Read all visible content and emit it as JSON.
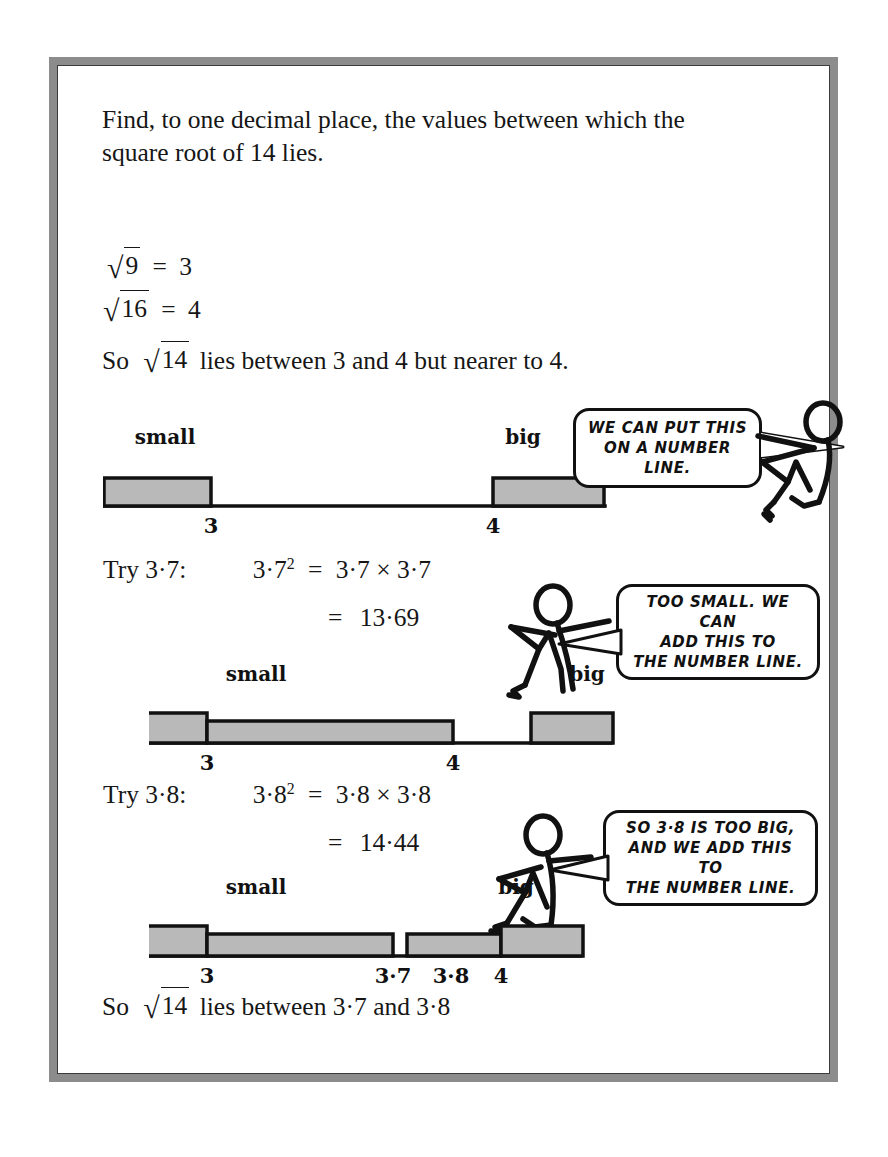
{
  "page": {
    "border_color": "#8c8c8c",
    "background": "#ffffff",
    "ink_color": "#161616"
  },
  "question": {
    "line1": "Find, to one decimal place, the values between which the",
    "line2": "square root of 14 lies."
  },
  "working": {
    "root9": {
      "sign": "√",
      "radicand": "9",
      "equals": "=",
      "result": "3"
    },
    "root16": {
      "sign": "√",
      "radicand": "16",
      "equals": "=",
      "result": "4"
    },
    "conclusion1_pre": "So",
    "conclusion1_sign": "√",
    "conclusion1_radicand": "14",
    "conclusion1_post": "lies between 3 and 4 but nearer to 4.",
    "try37": {
      "label": "Try 3·7:",
      "expr_base": "3·7",
      "expr_exp": "2",
      "equals": "=",
      "product": "3·7 × 3·7",
      "equals2": "=",
      "value": "13·69"
    },
    "try38": {
      "label": "Try 3·8:",
      "expr_base": "3·8",
      "expr_exp": "2",
      "equals": "=",
      "product": "3·8 × 3·8",
      "equals2": "=",
      "value": "14·44"
    },
    "final_pre": "So",
    "final_sign": "√",
    "final_radicand": "14",
    "final_post": "lies between 3·7 and 3·8"
  },
  "diagrams": [
    {
      "name": "number-line-1",
      "labels": [
        {
          "text": "small",
          "x": 62
        },
        {
          "text": "big",
          "x": 420
        }
      ],
      "ticks": [
        {
          "text": "3",
          "x": 108
        },
        {
          "text": "4",
          "x": 390
        }
      ],
      "bars": [
        {
          "x": 0,
          "width": 108,
          "height": 27
        },
        {
          "x": 390,
          "width": 112,
          "height": 27
        }
      ],
      "axis_width": 502
    },
    {
      "name": "number-line-2",
      "labels": [
        {
          "text": "small",
          "x": 107
        },
        {
          "text": "big",
          "x": 438
        }
      ],
      "ticks": [
        {
          "text": "3",
          "x": 58
        },
        {
          "text": "4",
          "x": 382
        }
      ],
      "bars": [
        {
          "x": 0,
          "width": 58,
          "height": 30
        },
        {
          "x": 58,
          "width": 246,
          "height": 22
        },
        {
          "x": 382,
          "width": 80,
          "height": 30
        }
      ],
      "axis_width": 462
    },
    {
      "name": "number-line-3",
      "labels": [
        {
          "text": "small",
          "x": 107
        },
        {
          "text": "big",
          "x": 367
        }
      ],
      "ticks": [
        {
          "text": "3",
          "x": 58
        },
        {
          "text": "3·7",
          "x": 244
        },
        {
          "text": "3·8",
          "x": 300
        },
        {
          "text": "4",
          "x": 352
        }
      ],
      "bars": [
        {
          "x": 0,
          "width": 58,
          "height": 30
        },
        {
          "x": 58,
          "width": 186,
          "height": 22
        },
        {
          "x": 258,
          "width": 94,
          "height": 22
        },
        {
          "x": 352,
          "width": 80,
          "height": 30
        }
      ],
      "axis_width": 432
    }
  ],
  "bubbles": [
    {
      "name": "speech-bubble-1",
      "text": "WE CAN PUT THIS\nON A NUMBER LINE."
    },
    {
      "name": "speech-bubble-2",
      "text": "TOO SMALL. WE CAN\nADD THIS TO\nTHE NUMBER LINE."
    },
    {
      "name": "speech-bubble-3",
      "text": "SO 3·8 IS TOO BIG,\nAND WE ADD THIS TO\nTHE NUMBER LINE."
    }
  ],
  "figures": [
    {
      "name": "stick-figure-1",
      "facing": "left"
    },
    {
      "name": "stick-figure-2",
      "facing": "right"
    },
    {
      "name": "stick-figure-3",
      "facing": "right"
    }
  ]
}
